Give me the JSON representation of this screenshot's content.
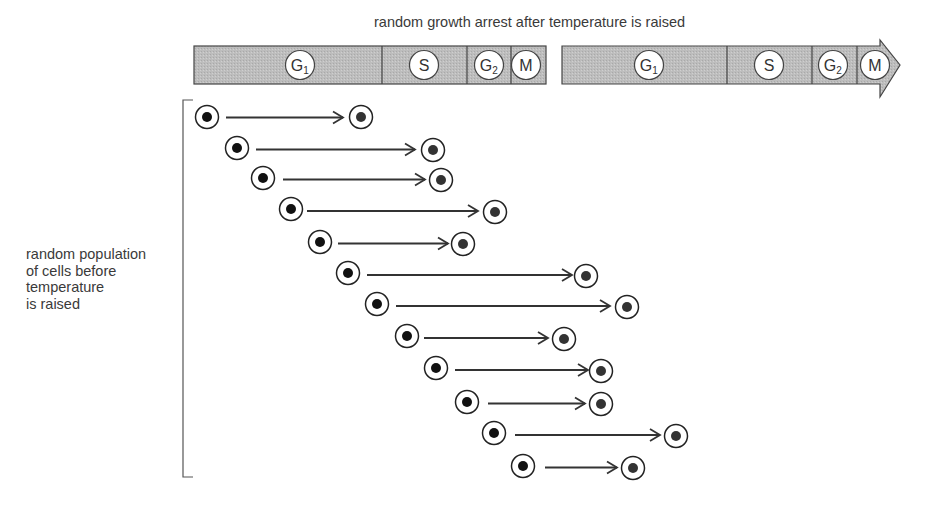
{
  "title": "random growth arrest after temperature is raised",
  "side_label": {
    "lines": [
      "random population",
      "of cells before",
      "temperature",
      "is raised"
    ]
  },
  "colors": {
    "phase_fill": "#bdbdbd",
    "stroke": "#444444",
    "cell_nucleus": "#111111",
    "arrested_nucleus": "#333333",
    "text": "#3a3a3a"
  },
  "cycle_bars": [
    {
      "x": 194,
      "y": 46,
      "h": 38,
      "end": 546,
      "arrow": false,
      "phases": [
        {
          "label": "G",
          "sub": "1",
          "from": 194,
          "to": 382,
          "cx": 300
        },
        {
          "label": "S",
          "sub": "",
          "from": 382,
          "to": 467,
          "cx": 424
        },
        {
          "label": "G",
          "sub": "2",
          "from": 467,
          "to": 511,
          "cx": 489
        },
        {
          "label": "M",
          "sub": "",
          "from": 511,
          "to": 546,
          "cx": 526
        }
      ]
    },
    {
      "x": 562,
      "y": 46,
      "h": 38,
      "end": 876,
      "arrow": true,
      "arrow_tip": 900,
      "arrow_top": 40,
      "arrow_bottom": 97,
      "phases": [
        {
          "label": "G",
          "sub": "1",
          "from": 562,
          "to": 727,
          "cx": 649
        },
        {
          "label": "S",
          "sub": "",
          "from": 727,
          "to": 812,
          "cx": 769
        },
        {
          "label": "G",
          "sub": "2",
          "from": 812,
          "to": 857,
          "cx": 833
        },
        {
          "label": "M",
          "sub": "",
          "from": 857,
          "to": 876,
          "cx": 875
        }
      ]
    }
  ],
  "bracket": {
    "x": 183,
    "top": 100,
    "bottom": 477,
    "tick": 10
  },
  "cells": [
    {
      "start": [
        207,
        117
      ],
      "arrow_from": 226,
      "arrow_to": 343,
      "end": [
        361,
        117
      ]
    },
    {
      "start": [
        237,
        148
      ],
      "arrow_from": 256,
      "arrow_to": 415,
      "end": [
        433,
        150
      ]
    },
    {
      "start": [
        263,
        178
      ],
      "arrow_from": 283,
      "arrow_to": 425,
      "end": [
        441,
        180
      ]
    },
    {
      "start": [
        291,
        209
      ],
      "arrow_from": 307,
      "arrow_to": 478,
      "end": [
        495,
        212
      ]
    },
    {
      "start": [
        320,
        242
      ],
      "arrow_from": 338,
      "arrow_to": 448,
      "end": [
        463,
        244
      ]
    },
    {
      "start": [
        348,
        273
      ],
      "arrow_from": 367,
      "arrow_to": 572,
      "end": [
        586,
        276
      ]
    },
    {
      "start": [
        377,
        304
      ],
      "arrow_from": 396,
      "arrow_to": 610,
      "end": [
        627,
        307
      ]
    },
    {
      "start": [
        407,
        336
      ],
      "arrow_from": 424,
      "arrow_to": 548,
      "end": [
        564,
        339
      ]
    },
    {
      "start": [
        436,
        368
      ],
      "arrow_from": 455,
      "arrow_to": 588,
      "end": [
        601,
        371
      ]
    },
    {
      "start": [
        467,
        402
      ],
      "arrow_from": 488,
      "arrow_to": 585,
      "end": [
        601,
        404
      ]
    },
    {
      "start": [
        494,
        433
      ],
      "arrow_from": 515,
      "arrow_to": 660,
      "end": [
        676,
        436
      ]
    },
    {
      "start": [
        523,
        466
      ],
      "arrow_from": 545,
      "arrow_to": 617,
      "end": [
        633,
        468
      ]
    }
  ]
}
